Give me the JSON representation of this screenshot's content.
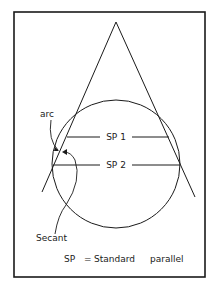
{
  "diagram": {
    "type": "secant conic projection",
    "labels": {
      "arc": "arc",
      "sp1": "SP 1",
      "sp2": "SP 2",
      "secant": "Secant",
      "legend": "SP = Standard parallel"
    },
    "legend_parts": {
      "abbr": "SP",
      "eq": "=",
      "word1": "Standard",
      "word2": "parallel"
    },
    "colors": {
      "stroke": "#1a1a1a",
      "background": "#ffffff"
    }
  }
}
